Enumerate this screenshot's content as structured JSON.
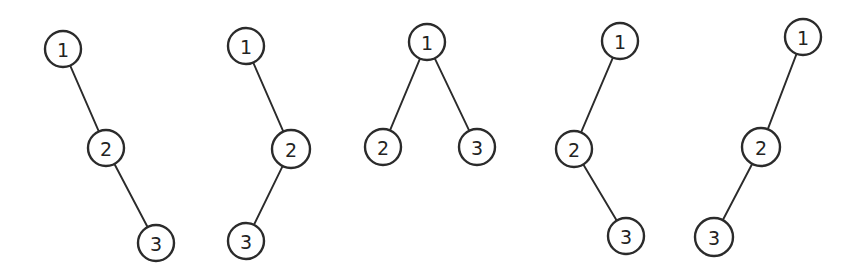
{
  "figure": {
    "background_color": "#ffffff",
    "stroke_color": "#2b2b2b",
    "label_color": "#232323",
    "width": 865,
    "height": 275
  },
  "chart_data": {
    "type": "diagram",
    "diagram_kind": "binary-tree-enumeration",
    "title": "",
    "node_labels": [
      "1",
      "2",
      "3"
    ],
    "node_radius": 18,
    "trees": [
      {
        "name": "tree-1",
        "shape": "right-right-chain",
        "nodes": [
          {
            "id": "n1",
            "label": "1",
            "cx": 63,
            "cy": 49,
            "r": 18
          },
          {
            "id": "n2",
            "label": "2",
            "cx": 106,
            "cy": 148,
            "r": 18
          },
          {
            "id": "n3",
            "label": "3",
            "cx": 156,
            "cy": 243,
            "r": 18
          }
        ],
        "edges": [
          {
            "from": "n1",
            "to": "n2",
            "relation": "right-child"
          },
          {
            "from": "n2",
            "to": "n3",
            "relation": "right-child"
          }
        ]
      },
      {
        "name": "tree-2",
        "shape": "right-left-chain",
        "nodes": [
          {
            "id": "n1",
            "label": "1",
            "cx": 246,
            "cy": 46,
            "r": 18
          },
          {
            "id": "n2",
            "label": "2",
            "cx": 291,
            "cy": 149,
            "r": 19
          },
          {
            "id": "n3",
            "label": "3",
            "cx": 246,
            "cy": 241,
            "r": 18
          }
        ],
        "edges": [
          {
            "from": "n1",
            "to": "n2",
            "relation": "right-child"
          },
          {
            "from": "n2",
            "to": "n3",
            "relation": "left-child"
          }
        ]
      },
      {
        "name": "tree-3",
        "shape": "balanced-two-children",
        "nodes": [
          {
            "id": "n1",
            "label": "1",
            "cx": 427,
            "cy": 42,
            "r": 18
          },
          {
            "id": "n2",
            "label": "2",
            "cx": 383,
            "cy": 147,
            "r": 18
          },
          {
            "id": "n3",
            "label": "3",
            "cx": 477,
            "cy": 147,
            "r": 18
          }
        ],
        "edges": [
          {
            "from": "n1",
            "to": "n2",
            "relation": "left-child"
          },
          {
            "from": "n1",
            "to": "n3",
            "relation": "right-child"
          }
        ]
      },
      {
        "name": "tree-4",
        "shape": "left-right-chain",
        "nodes": [
          {
            "id": "n1",
            "label": "1",
            "cx": 620,
            "cy": 41,
            "r": 18
          },
          {
            "id": "n2",
            "label": "2",
            "cx": 574,
            "cy": 149,
            "r": 18
          },
          {
            "id": "n3",
            "label": "3",
            "cx": 626,
            "cy": 236,
            "r": 18
          }
        ],
        "edges": [
          {
            "from": "n1",
            "to": "n2",
            "relation": "left-child"
          },
          {
            "from": "n2",
            "to": "n3",
            "relation": "right-child"
          }
        ]
      },
      {
        "name": "tree-5",
        "shape": "left-left-chain",
        "nodes": [
          {
            "id": "n1",
            "label": "1",
            "cx": 803,
            "cy": 37,
            "r": 18
          },
          {
            "id": "n2",
            "label": "2",
            "cx": 761,
            "cy": 147,
            "r": 19
          },
          {
            "id": "n3",
            "label": "3",
            "cx": 714,
            "cy": 237,
            "r": 19
          }
        ],
        "edges": [
          {
            "from": "n1",
            "to": "n2",
            "relation": "left-child"
          },
          {
            "from": "n2",
            "to": "n3",
            "relation": "left-child"
          }
        ]
      }
    ]
  }
}
